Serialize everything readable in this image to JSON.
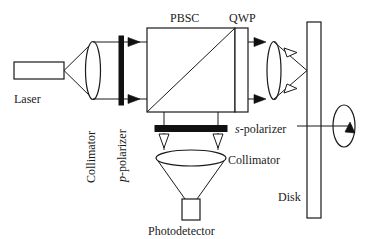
{
  "figure": {
    "type": "optical-system-schematic",
    "background_color": "#ffffff",
    "line_color": "#1a1a1a",
    "fill_color": "#111111"
  },
  "labels": {
    "laser": "Laser",
    "collimator_left": "Collimator",
    "p_polarizer_italic": "p",
    "p_polarizer_rest": "-polarizer",
    "pbsc": "PBSC",
    "qwp": "QWP",
    "s_polarizer_italic": "s",
    "s_polarizer_rest": "-polarizer",
    "collimator_bottom": "Collimator",
    "photodetector": "Photodetector",
    "disk": "Disk"
  },
  "components": [
    {
      "name": "laser",
      "label": "Laser",
      "shape": "rectangle"
    },
    {
      "name": "collimator-lens-left",
      "label": "Collimator",
      "shape": "biconvex-lens"
    },
    {
      "name": "p-polarizer",
      "label": "p-polarizer",
      "shape": "vertical-bar"
    },
    {
      "name": "pbsc",
      "label": "PBSC",
      "shape": "square-with-diagonal"
    },
    {
      "name": "qwp",
      "label": "QWP",
      "shape": "thin-vertical-slab"
    },
    {
      "name": "objective-lens",
      "label": "",
      "shape": "biconvex-lens"
    },
    {
      "name": "disk",
      "label": "Disk",
      "shape": "tall-rectangle"
    },
    {
      "name": "rotation-indicator",
      "label": "",
      "shape": "ellipse-with-arrow"
    },
    {
      "name": "s-polarizer",
      "label": "s-polarizer",
      "shape": "horizontal-bar"
    },
    {
      "name": "collimator-lens-bottom",
      "label": "Collimator",
      "shape": "biconvex-lens"
    },
    {
      "name": "photodetector",
      "label": "Photodetector",
      "shape": "rectangle"
    }
  ],
  "beams": [
    {
      "name": "laser-to-collimator",
      "style": "diverging-rays",
      "arrowhead": "none"
    },
    {
      "name": "collimator-to-pbsc",
      "style": "parallel-rays",
      "arrowhead": "solid"
    },
    {
      "name": "pbsc-to-objective",
      "style": "parallel-rays",
      "arrowhead": "solid"
    },
    {
      "name": "objective-to-disk",
      "style": "converging-rays",
      "arrowhead": "hollow-return"
    },
    {
      "name": "pbsc-to-s-polarizer",
      "style": "parallel-rays",
      "arrowhead": "hollow"
    },
    {
      "name": "s-polarizer-to-collimator",
      "style": "parallel-rays",
      "arrowhead": "hollow"
    },
    {
      "name": "collimator-to-photodetector",
      "style": "converging-rays",
      "arrowhead": "none"
    }
  ]
}
